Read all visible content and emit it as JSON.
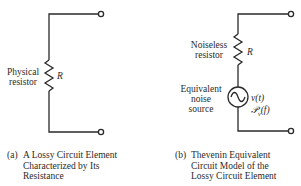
{
  "panels": [
    {
      "id": "a",
      "resistor_label": "Physical\nresistor",
      "resistor_label_lines": [
        "Physical",
        "resistor"
      ],
      "resistor_symbol": "R",
      "caption_tag": "(a)",
      "caption_lines": [
        "A Lossy Circuit Element",
        "Characterized by Its",
        "Resistance"
      ]
    },
    {
      "id": "b",
      "resistor_label_lines": [
        "Noiseless",
        "resistor"
      ],
      "resistor_symbol": "R",
      "source_label_lines": [
        "Equivalent",
        "noise",
        "source"
      ],
      "source_voltage": "v(t)",
      "source_psd": "ℬv(f)",
      "source_psd_parts": {
        "symbol": "𝒫",
        "subscript": "v",
        "arg": "(f)"
      },
      "caption_tag": "(b)",
      "caption_lines": [
        "Thevenin Equivalent",
        "Circuit Model of the",
        "Lossy Circuit Element"
      ]
    }
  ],
  "colors": {
    "line": "#2a2a2a",
    "background": "#ffffff"
  }
}
